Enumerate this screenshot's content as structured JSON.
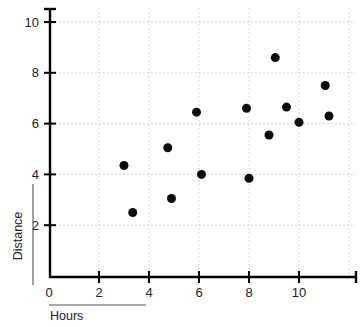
{
  "chart_data": {
    "type": "scatter",
    "title": "",
    "xlabel": "Hours",
    "ylabel": "Distance",
    "xlim": [
      0,
      12.1
    ],
    "ylim": [
      0,
      10.6
    ],
    "grid": true,
    "legend": null,
    "x_ticks": [
      0,
      2,
      4,
      6,
      8,
      10
    ],
    "y_ticks": [
      2,
      4,
      6,
      8,
      10
    ],
    "x_tick_labels": [
      "0",
      "2",
      "4",
      "6",
      "8",
      "10"
    ],
    "y_tick_labels": [
      "2",
      "4",
      "6",
      "8",
      "10"
    ],
    "marker": {
      "shape": "circle",
      "color": "#0d0d0d",
      "size": 9
    },
    "points": [
      {
        "x": 3.0,
        "y": 4.35
      },
      {
        "x": 3.35,
        "y": 2.5
      },
      {
        "x": 4.75,
        "y": 5.05
      },
      {
        "x": 4.9,
        "y": 3.05
      },
      {
        "x": 5.9,
        "y": 6.45
      },
      {
        "x": 6.1,
        "y": 4.0
      },
      {
        "x": 7.9,
        "y": 6.6
      },
      {
        "x": 8.0,
        "y": 3.85
      },
      {
        "x": 8.8,
        "y": 5.55
      },
      {
        "x": 9.05,
        "y": 8.6
      },
      {
        "x": 9.5,
        "y": 6.65
      },
      {
        "x": 10.0,
        "y": 6.05
      },
      {
        "x": 11.05,
        "y": 7.5
      },
      {
        "x": 11.2,
        "y": 6.3
      }
    ]
  },
  "labels": {
    "x_axis_title": "Hours",
    "y_axis_title": "Distance"
  },
  "colors": {
    "marker": "#0d0d0d",
    "grid": "#cfcfcf",
    "axis": "#000000",
    "background": "#ffffff"
  }
}
